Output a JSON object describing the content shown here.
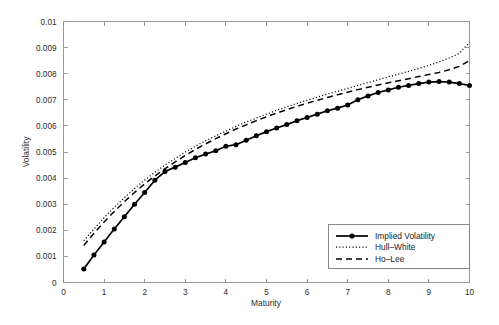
{
  "chart_data": {
    "type": "line",
    "title": "",
    "xlabel": "Maturity",
    "ylabel": "Volatility",
    "xlim": [
      0,
      10
    ],
    "ylim": [
      0,
      0.01
    ],
    "grid": false,
    "legend_position": "lower right",
    "xticks": [
      "0",
      "1",
      "2",
      "3",
      "4",
      "5",
      "6",
      "7",
      "8",
      "9",
      "10"
    ],
    "xtick_values": [
      0,
      1,
      2,
      3,
      4,
      5,
      6,
      7,
      8,
      9,
      10
    ],
    "yticks": [
      "0",
      "0.001",
      "0.002",
      "0.003",
      "0.004",
      "0.005",
      "0.006",
      "0.007",
      "0.008",
      "0.009",
      "0.01"
    ],
    "ytick_values": [
      0,
      0.001,
      0.002,
      0.003,
      0.004,
      0.005,
      0.006,
      0.007,
      0.008,
      0.009,
      0.01
    ],
    "x": [
      0.5,
      0.75,
      1.0,
      1.25,
      1.5,
      1.75,
      2.0,
      2.25,
      2.5,
      2.75,
      3.0,
      3.25,
      3.5,
      3.75,
      4.0,
      4.25,
      4.5,
      4.75,
      5.0,
      5.25,
      5.5,
      5.75,
      6.0,
      6.25,
      6.5,
      6.75,
      7.0,
      7.25,
      7.5,
      7.75,
      8.0,
      8.25,
      8.5,
      8.75,
      9.0,
      9.25,
      9.5,
      9.75,
      10.0
    ],
    "series": [
      {
        "name": "Implied Volatility",
        "style": "solid",
        "marker": "filled-circle",
        "color": "#000000",
        "values": [
          0.00052,
          0.00105,
          0.00155,
          0.00205,
          0.00252,
          0.003,
          0.00345,
          0.00392,
          0.00425,
          0.00442,
          0.0046,
          0.00478,
          0.00492,
          0.00505,
          0.00522,
          0.00528,
          0.00545,
          0.00562,
          0.00578,
          0.00592,
          0.00605,
          0.0062,
          0.00632,
          0.00645,
          0.00658,
          0.00668,
          0.0068,
          0.007,
          0.00715,
          0.00728,
          0.00738,
          0.00748,
          0.00755,
          0.00762,
          0.00768,
          0.0077,
          0.00768,
          0.00762,
          0.00755
        ]
      },
      {
        "name": "Hull-White",
        "style": "dotted",
        "marker": "none",
        "color": "#000000",
        "values": [
          0.0016,
          0.00205,
          0.00248,
          0.00288,
          0.00325,
          0.0036,
          0.00393,
          0.00422,
          0.0045,
          0.00475,
          0.005,
          0.00522,
          0.00543,
          0.00562,
          0.0058,
          0.00598,
          0.00615,
          0.0063,
          0.00645,
          0.0066,
          0.00673,
          0.00686,
          0.00698,
          0.0071,
          0.00722,
          0.00733,
          0.00744,
          0.00755,
          0.00766,
          0.00777,
          0.00788,
          0.00798,
          0.00809,
          0.0082,
          0.00832,
          0.00845,
          0.0086,
          0.00878,
          0.0092
        ]
      },
      {
        "name": "Ho-Lee",
        "style": "dashed",
        "marker": "none",
        "color": "#000000",
        "values": [
          0.00142,
          0.00188,
          0.00232,
          0.00272,
          0.0031,
          0.00345,
          0.00378,
          0.00408,
          0.00436,
          0.00462,
          0.00487,
          0.0051,
          0.00531,
          0.00551,
          0.0057,
          0.00588,
          0.00604,
          0.0062,
          0.00635,
          0.00649,
          0.00662,
          0.00675,
          0.00687,
          0.00698,
          0.00709,
          0.00719,
          0.00729,
          0.00739,
          0.00748,
          0.00757,
          0.00765,
          0.00773,
          0.00781,
          0.00789,
          0.00797,
          0.00805,
          0.00815,
          0.00828,
          0.0085
        ]
      }
    ]
  },
  "legend": {
    "entries": [
      {
        "label": "Implied Volatility"
      },
      {
        "label": "Hull–White"
      },
      {
        "label": "Ho–Lee"
      }
    ]
  }
}
